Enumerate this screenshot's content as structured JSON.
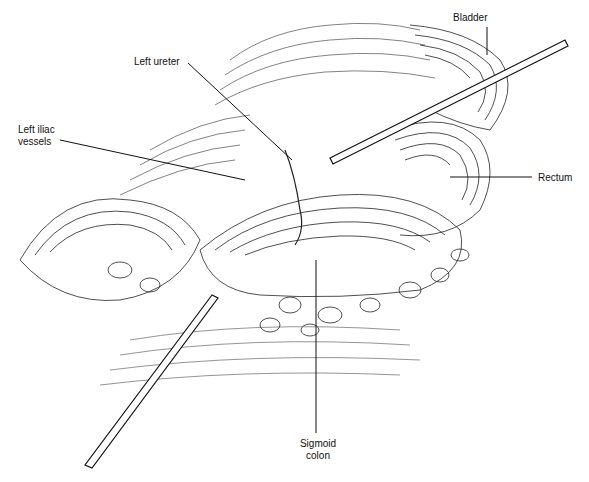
{
  "figure": {
    "labels": {
      "bladder": "Bladder",
      "left_ureter": "Left ureter",
      "left_iliac_1": "Left iliac",
      "left_iliac_2": "vessels",
      "rectum": "Rectum",
      "sigmoid_1": "Sigmoid",
      "sigmoid_2": "colon"
    },
    "ink_color": "#111111",
    "background": "#ffffff"
  }
}
